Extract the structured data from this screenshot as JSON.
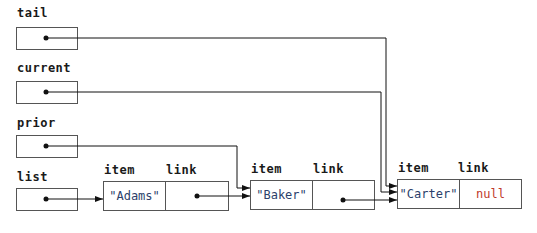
{
  "references": [
    {
      "name": "tail",
      "label": "tail"
    },
    {
      "name": "current",
      "label": "current"
    },
    {
      "name": "prior",
      "label": "prior"
    },
    {
      "name": "list",
      "label": "list"
    }
  ],
  "node_headers": {
    "item": "item",
    "link": "link"
  },
  "nodes": [
    {
      "item": "\"Adams\"",
      "link": ""
    },
    {
      "item": "\"Baker\"",
      "link": ""
    },
    {
      "item": "\"Carter\"",
      "link": "null"
    }
  ],
  "colors": {
    "string_value": "#2c3f6b",
    "null_value": "#c0392b",
    "line": "#111111"
  }
}
